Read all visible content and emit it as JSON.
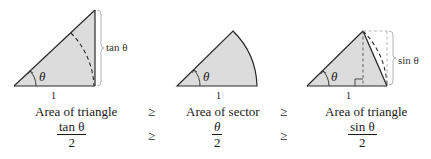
{
  "figures": [
    {
      "id": "large-triangle",
      "angle_label": "θ",
      "base_label": "1",
      "side_label": "tan θ"
    },
    {
      "id": "sector",
      "angle_label": "θ",
      "base_label": "1"
    },
    {
      "id": "small-triangle",
      "angle_label": "θ",
      "base_label": "1",
      "side_label": "sin θ"
    }
  ],
  "row1": {
    "left": "Area of triangle",
    "op1": "≥",
    "middle": "Area of sector",
    "op2": "≥",
    "right": "Area of triangle"
  },
  "row2": {
    "left_num": "tan θ",
    "left_den": "2",
    "op1": "≥",
    "middle_num": "θ",
    "middle_den": "2",
    "op2": "≥",
    "right_num": "sin θ",
    "right_den": "2"
  },
  "colors": {
    "fill": "#dcdcdc",
    "stroke": "#2a2a2a",
    "bracket": "#aaaaaa"
  }
}
